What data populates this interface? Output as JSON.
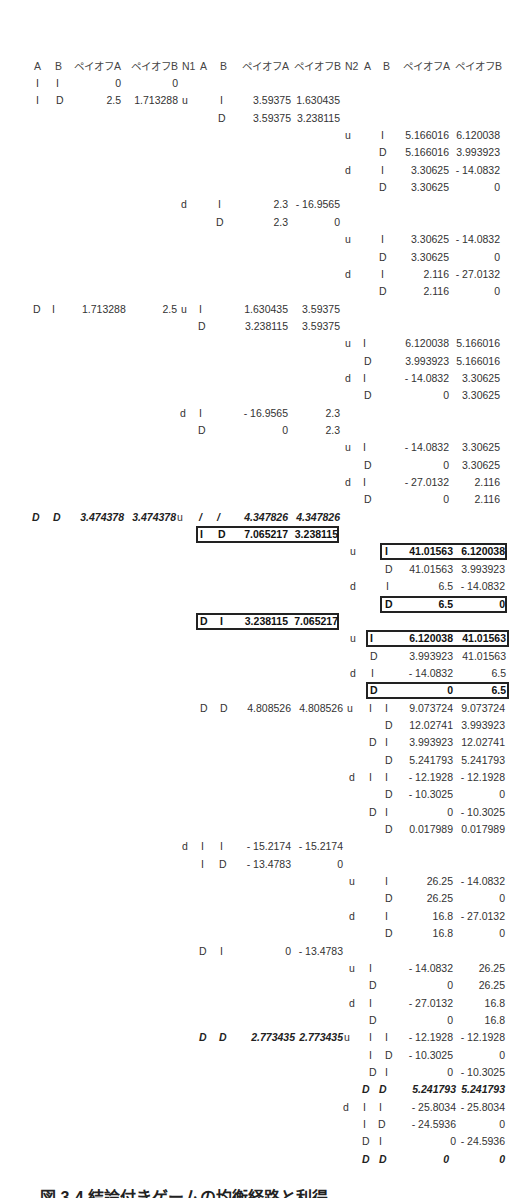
{
  "header": [
    "A",
    "B",
    "ペイオフA",
    "ペイオフB",
    "N1",
    "A",
    "B",
    "ペイオフA",
    "ペイオフB",
    "N2",
    "A",
    "B",
    "ペイオフA",
    "ペイオフB"
  ],
  "rows": [
    {
      "cells": [
        {
          "x": 36,
          "t": "I"
        },
        {
          "x": 56,
          "t": "I"
        },
        {
          "xr": 121,
          "t": "0"
        },
        {
          "xr": 178,
          "t": "0"
        }
      ]
    },
    {
      "cells": [
        {
          "x": 36,
          "t": "I"
        },
        {
          "x": 56,
          "t": "D"
        },
        {
          "xr": 121,
          "t": "2.5"
        },
        {
          "xr": 178,
          "t": "1.713288"
        },
        {
          "x": 182,
          "t": "u"
        },
        {
          "x": 220,
          "t": "I"
        },
        {
          "xr": 291,
          "t": "3.59375"
        },
        {
          "xr": 340,
          "t": "1.630435"
        }
      ]
    },
    {
      "cells": [
        {
          "x": 218,
          "t": "D"
        },
        {
          "xr": 291,
          "t": "3.59375"
        },
        {
          "xr": 340,
          "t": "3.238115"
        }
      ]
    },
    {
      "cells": [
        {
          "x": 345,
          "t": "u"
        },
        {
          "x": 381,
          "t": "I"
        },
        {
          "xr": 449,
          "t": "5.166016"
        },
        {
          "xr": 500,
          "t": "6.120038"
        }
      ]
    },
    {
      "cells": [
        {
          "x": 379,
          "t": "D"
        },
        {
          "xr": 449,
          "t": "5.166016"
        },
        {
          "xr": 500,
          "t": "3.993923"
        }
      ]
    },
    {
      "cells": [
        {
          "x": 345,
          "t": "d"
        },
        {
          "x": 381,
          "t": "I"
        },
        {
          "xr": 449,
          "t": "3.30625"
        },
        {
          "xr": 500,
          "t": "- 14.0832"
        }
      ]
    },
    {
      "cells": [
        {
          "x": 379,
          "t": "D"
        },
        {
          "xr": 449,
          "t": "3.30625"
        },
        {
          "xr": 500,
          "t": "0"
        }
      ]
    },
    {
      "cells": [
        {
          "x": 181,
          "t": "d"
        },
        {
          "x": 218,
          "t": "I"
        },
        {
          "xr": 288,
          "t": "2.3"
        },
        {
          "xr": 340,
          "t": "- 16.9565"
        }
      ]
    },
    {
      "cells": [
        {
          "x": 216,
          "t": "D"
        },
        {
          "xr": 288,
          "t": "2.3"
        },
        {
          "xr": 340,
          "t": "0"
        }
      ]
    },
    {
      "cells": [
        {
          "x": 345,
          "t": "u"
        },
        {
          "x": 381,
          "t": "I"
        },
        {
          "xr": 449,
          "t": "3.30625"
        },
        {
          "xr": 500,
          "t": "- 14.0832"
        }
      ]
    },
    {
      "cells": [
        {
          "x": 379,
          "t": "D"
        },
        {
          "xr": 449,
          "t": "3.30625"
        },
        {
          "xr": 500,
          "t": "0"
        }
      ]
    },
    {
      "cells": [
        {
          "x": 345,
          "t": "d"
        },
        {
          "x": 381,
          "t": "I"
        },
        {
          "xr": 449,
          "t": "2.116"
        },
        {
          "xr": 500,
          "t": "- 27.0132"
        }
      ]
    },
    {
      "cells": [
        {
          "x": 379,
          "t": "D"
        },
        {
          "xr": 449,
          "t": "2.116"
        },
        {
          "xr": 500,
          "t": "0"
        }
      ]
    },
    {
      "cells": [
        {
          "x": 33,
          "t": "D"
        },
        {
          "x": 52,
          "t": "I"
        },
        {
          "x": 82,
          "t": "1.713288"
        },
        {
          "xr": 177,
          "t": "2.5"
        },
        {
          "x": 181,
          "t": "u"
        },
        {
          "x": 199,
          "t": "I"
        },
        {
          "xr": 288,
          "t": "1.630435"
        },
        {
          "xr": 340,
          "t": "3.59375"
        }
      ]
    },
    {
      "cells": [
        {
          "x": 198,
          "t": "D"
        },
        {
          "xr": 288,
          "t": "3.238115"
        },
        {
          "xr": 340,
          "t": "3.59375"
        }
      ]
    },
    {
      "cells": [
        {
          "x": 345,
          "t": "u"
        },
        {
          "x": 363,
          "t": "I"
        },
        {
          "xr": 449,
          "t": "6.120038"
        },
        {
          "xr": 500,
          "t": "5.166016"
        }
      ]
    },
    {
      "cells": [
        {
          "x": 364,
          "t": "D"
        },
        {
          "xr": 449,
          "t": "3.993923"
        },
        {
          "xr": 500,
          "t": "5.166016"
        }
      ]
    },
    {
      "cells": [
        {
          "x": 345,
          "t": "d"
        },
        {
          "x": 363,
          "t": "I"
        },
        {
          "xr": 449,
          "t": "- 14.0832"
        },
        {
          "xr": 500,
          "t": "3.30625"
        }
      ]
    },
    {
      "cells": [
        {
          "x": 364,
          "t": "D"
        },
        {
          "xr": 449,
          "t": "0"
        },
        {
          "xr": 500,
          "t": "3.30625"
        }
      ]
    },
    {
      "cells": [
        {
          "x": 180,
          "t": "d"
        },
        {
          "x": 199,
          "t": "I"
        },
        {
          "xr": 288,
          "t": "- 16.9565"
        },
        {
          "xr": 340,
          "t": "2.3"
        }
      ]
    },
    {
      "cells": [
        {
          "x": 198,
          "t": "D"
        },
        {
          "xr": 288,
          "t": "0"
        },
        {
          "xr": 340,
          "t": "2.3"
        }
      ]
    },
    {
      "cells": [
        {
          "x": 345,
          "t": "u"
        },
        {
          "x": 363,
          "t": "I"
        },
        {
          "xr": 449,
          "t": "- 14.0832"
        },
        {
          "xr": 500,
          "t": "3.30625"
        }
      ]
    },
    {
      "cells": [
        {
          "x": 364,
          "t": "D"
        },
        {
          "xr": 449,
          "t": "0"
        },
        {
          "xr": 500,
          "t": "3.30625"
        }
      ]
    },
    {
      "cells": [
        {
          "x": 345,
          "t": "d"
        },
        {
          "x": 363,
          "t": "I"
        },
        {
          "xr": 449,
          "t": "- 27.0132"
        },
        {
          "xr": 500,
          "t": "2.116"
        }
      ]
    },
    {
      "cells": [
        {
          "x": 364,
          "t": "D"
        },
        {
          "xr": 449,
          "t": "0"
        },
        {
          "xr": 500,
          "t": "2.116"
        }
      ]
    },
    {
      "style": "it",
      "cells": [
        {
          "x": 32,
          "t": "D"
        },
        {
          "x": 53,
          "t": "D"
        },
        {
          "xr": 124,
          "t": "3.474378"
        },
        {
          "xr": 176,
          "t": "3.474378"
        },
        {
          "x": 177,
          "t": "u",
          "plain": true
        },
        {
          "x": 199,
          "t": "/"
        },
        {
          "x": 217,
          "t": "/"
        },
        {
          "xr": 288,
          "t": "4.347826"
        },
        {
          "xr": 340,
          "t": "4.347826"
        }
      ]
    },
    {
      "box": [
        196,
        339
      ],
      "style": "bd",
      "cells": [
        {
          "x": 200,
          "t": "I"
        },
        {
          "x": 218,
          "t": "D"
        },
        {
          "xr": 288,
          "t": "7.065217"
        },
        {
          "xr": 338,
          "t": "3.238115"
        }
      ]
    },
    {
      "box": [
        380,
        507
      ],
      "cells": [
        {
          "x": 350,
          "t": "u"
        },
        {
          "x": 385,
          "t": "I",
          "bd": true
        },
        {
          "xr": 453,
          "t": "41.01563",
          "bd": true
        },
        {
          "xr": 505,
          "t": "6.120038",
          "bd": true
        }
      ]
    },
    {
      "cells": [
        {
          "x": 385,
          "t": "D"
        },
        {
          "xr": 453,
          "t": "41.01563"
        },
        {
          "xr": 505,
          "t": "3.993923"
        }
      ]
    },
    {
      "cells": [
        {
          "x": 350,
          "t": "d"
        },
        {
          "x": 386,
          "t": "I"
        },
        {
          "xr": 453,
          "t": "6.5"
        },
        {
          "xr": 505,
          "t": "- 14.0832"
        }
      ]
    },
    {
      "box": [
        380,
        507
      ],
      "style": "bd",
      "cells": [
        {
          "x": 385,
          "t": "D"
        },
        {
          "xr": 453,
          "t": "6.5"
        },
        {
          "xr": 505,
          "t": "0"
        }
      ]
    },
    {
      "box": [
        196,
        339
      ],
      "style": "bd",
      "cells": [
        {
          "x": 200,
          "t": "D"
        },
        {
          "x": 220,
          "t": "I"
        },
        {
          "xr": 288,
          "t": "3.238115"
        },
        {
          "xr": 338,
          "t": "7.065217"
        }
      ]
    },
    {
      "box": [
        366,
        509
      ],
      "cells": [
        {
          "x": 350,
          "t": "u"
        },
        {
          "x": 370,
          "t": "I",
          "bd": true
        },
        {
          "xr": 453,
          "t": "6.120038",
          "bd": true
        },
        {
          "xr": 506,
          "t": "41.01563",
          "bd": true
        }
      ]
    },
    {
      "cells": [
        {
          "x": 370,
          "t": "D"
        },
        {
          "xr": 453,
          "t": "3.993923"
        },
        {
          "xr": 506,
          "t": "41.01563"
        }
      ]
    },
    {
      "cells": [
        {
          "x": 350,
          "t": "d"
        },
        {
          "x": 371,
          "t": "I"
        },
        {
          "xr": 453,
          "t": "- 14.0832"
        },
        {
          "xr": 506,
          "t": "6.5"
        }
      ]
    },
    {
      "box": [
        366,
        509
      ],
      "style": "bd",
      "cells": [
        {
          "x": 370,
          "t": "D"
        },
        {
          "xr": 453,
          "t": "0"
        },
        {
          "xr": 506,
          "t": "6.5"
        }
      ]
    },
    {
      "cells": [
        {
          "x": 200,
          "t": "D"
        },
        {
          "x": 220,
          "t": "D"
        },
        {
          "xr": 291,
          "t": "4.808526"
        },
        {
          "xr": 343,
          "t": "4.808526"
        },
        {
          "x": 347,
          "t": "u"
        },
        {
          "x": 369,
          "t": "I"
        },
        {
          "x": 385,
          "t": "I"
        },
        {
          "xr": 453,
          "t": "9.073724"
        },
        {
          "xr": 505,
          "t": "9.073724"
        }
      ]
    },
    {
      "cells": [
        {
          "x": 385,
          "t": "D"
        },
        {
          "xr": 453,
          "t": "12.02741"
        },
        {
          "xr": 505,
          "t": "3.993923"
        }
      ]
    },
    {
      "cells": [
        {
          "x": 369,
          "t": "D"
        },
        {
          "x": 385,
          "t": "I"
        },
        {
          "xr": 453,
          "t": "3.993923"
        },
        {
          "xr": 505,
          "t": "12.02741"
        }
      ]
    },
    {
      "cells": [
        {
          "x": 385,
          "t": "D"
        },
        {
          "xr": 453,
          "t": "5.241793"
        },
        {
          "xr": 505,
          "t": "5.241793"
        }
      ]
    },
    {
      "cells": [
        {
          "x": 349,
          "t": "d"
        },
        {
          "x": 369,
          "t": "I"
        },
        {
          "x": 385,
          "t": "I"
        },
        {
          "xr": 453,
          "t": "- 12.1928"
        },
        {
          "xr": 505,
          "t": "- 12.1928"
        }
      ]
    },
    {
      "cells": [
        {
          "x": 385,
          "t": "D"
        },
        {
          "xr": 453,
          "t": "- 10.3025"
        },
        {
          "xr": 505,
          "t": "0"
        }
      ]
    },
    {
      "cells": [
        {
          "x": 369,
          "t": "D"
        },
        {
          "x": 385,
          "t": "I"
        },
        {
          "xr": 453,
          "t": "0"
        },
        {
          "xr": 505,
          "t": "- 10.3025"
        }
      ]
    },
    {
      "cells": [
        {
          "x": 385,
          "t": "D"
        },
        {
          "xr": 453,
          "t": "0.017989"
        },
        {
          "xr": 505,
          "t": "0.017989"
        }
      ]
    },
    {
      "cells": [
        {
          "x": 182,
          "t": "d"
        },
        {
          "x": 201,
          "t": "I"
        },
        {
          "x": 220,
          "t": "I"
        },
        {
          "xr": 291,
          "t": "- 15.2174"
        },
        {
          "xr": 343,
          "t": "- 15.2174"
        }
      ]
    },
    {
      "cells": [
        {
          "x": 201,
          "t": "I"
        },
        {
          "x": 219,
          "t": "D"
        },
        {
          "xr": 291,
          "t": "- 13.4783"
        },
        {
          "xr": 343,
          "t": "0"
        }
      ]
    },
    {
      "cells": [
        {
          "x": 349,
          "t": "u"
        },
        {
          "x": 385,
          "t": "I"
        },
        {
          "xr": 453,
          "t": "26.25"
        },
        {
          "xr": 505,
          "t": "- 14.0832"
        }
      ]
    },
    {
      "cells": [
        {
          "x": 385,
          "t": "D"
        },
        {
          "xr": 453,
          "t": "26.25"
        },
        {
          "xr": 505,
          "t": "0"
        }
      ]
    },
    {
      "cells": [
        {
          "x": 349,
          "t": "d"
        },
        {
          "x": 385,
          "t": "I"
        },
        {
          "xr": 453,
          "t": "16.8"
        },
        {
          "xr": 505,
          "t": "- 27.0132"
        }
      ]
    },
    {
      "cells": [
        {
          "x": 385,
          "t": "D"
        },
        {
          "xr": 453,
          "t": "16.8"
        },
        {
          "xr": 505,
          "t": "0"
        }
      ]
    },
    {
      "cells": [
        {
          "x": 199,
          "t": "D"
        },
        {
          "x": 220,
          "t": "I"
        },
        {
          "xr": 291,
          "t": "0"
        },
        {
          "xr": 343,
          "t": "- 13.4783"
        }
      ]
    },
    {
      "cells": [
        {
          "x": 349,
          "t": "u"
        },
        {
          "x": 369,
          "t": "I"
        },
        {
          "xr": 453,
          "t": "- 14.0832"
        },
        {
          "xr": 505,
          "t": "26.25"
        }
      ]
    },
    {
      "cells": [
        {
          "x": 369,
          "t": "D"
        },
        {
          "xr": 453,
          "t": "0"
        },
        {
          "xr": 505,
          "t": "26.25"
        }
      ]
    },
    {
      "cells": [
        {
          "x": 349,
          "t": "d"
        },
        {
          "x": 369,
          "t": "I"
        },
        {
          "xr": 453,
          "t": "- 27.0132"
        },
        {
          "xr": 505,
          "t": "16.8"
        }
      ]
    },
    {
      "cells": [
        {
          "x": 369,
          "t": "D"
        },
        {
          "xr": 453,
          "t": "0"
        },
        {
          "xr": 505,
          "t": "16.8"
        }
      ]
    },
    {
      "style": "it",
      "cells": [
        {
          "x": 199,
          "t": "D"
        },
        {
          "x": 219,
          "t": "D"
        },
        {
          "xr": 295,
          "t": "2.773435"
        },
        {
          "xr": 343,
          "t": "2.773435"
        },
        {
          "x": 344,
          "t": "u",
          "plain": true
        },
        {
          "x": 369,
          "t": "I",
          "plain": true
        },
        {
          "x": 385,
          "t": "I",
          "plain": true
        },
        {
          "xr": 453,
          "t": "- 12.1928",
          "plain": true
        },
        {
          "xr": 505,
          "t": "- 12.1928",
          "plain": true
        }
      ]
    },
    {
      "cells": [
        {
          "x": 369,
          "t": "I"
        },
        {
          "x": 385,
          "t": "D"
        },
        {
          "xr": 453,
          "t": "- 10.3025"
        },
        {
          "xr": 505,
          "t": "0"
        }
      ]
    },
    {
      "cells": [
        {
          "x": 369,
          "t": "D"
        },
        {
          "x": 385,
          "t": "I"
        },
        {
          "xr": 453,
          "t": "0"
        },
        {
          "xr": 505,
          "t": "- 10.3025"
        }
      ]
    },
    {
      "style": "it",
      "cells": [
        {
          "x": 362,
          "t": "D"
        },
        {
          "x": 379,
          "t": "D"
        },
        {
          "xr": 456,
          "t": "5.241793"
        },
        {
          "xr": 505,
          "t": "5.241793"
        }
      ]
    },
    {
      "cells": [
        {
          "x": 343,
          "t": "d"
        },
        {
          "x": 363,
          "t": "I"
        },
        {
          "x": 379,
          "t": "I"
        },
        {
          "xr": 456,
          "t": "- 25.8034"
        },
        {
          "xr": 505,
          "t": "- 25.8034"
        }
      ]
    },
    {
      "cells": [
        {
          "x": 363,
          "t": "I"
        },
        {
          "x": 378,
          "t": "D"
        },
        {
          "xr": 456,
          "t": "- 24.5936"
        },
        {
          "xr": 505,
          "t": "0"
        }
      ]
    },
    {
      "cells": [
        {
          "x": 362,
          "t": "D"
        },
        {
          "x": 379,
          "t": "I"
        },
        {
          "xr": 456,
          "t": "0"
        },
        {
          "xr": 505,
          "t": "- 24.5936"
        }
      ]
    },
    {
      "style": "it",
      "cells": [
        {
          "x": 362,
          "t": "D"
        },
        {
          "x": 379,
          "t": "D"
        },
        {
          "xr": 449,
          "t": "0"
        },
        {
          "xr": 505,
          "t": "0"
        }
      ]
    }
  ],
  "caption": "図 3-4 結論付きゲームの均衡経路と利得"
}
